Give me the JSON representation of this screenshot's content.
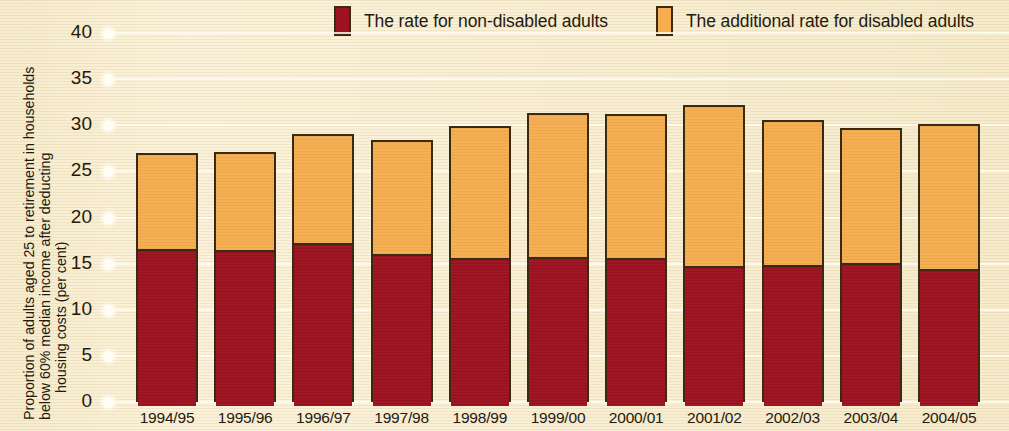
{
  "chart_data": {
    "type": "bar",
    "stacked": true,
    "title": "",
    "xlabel": "",
    "ylabel": "Proportion of adults aged 25 to retirement in households below 60% median income after deducting housing costs (per cent)",
    "ylabel_lines": [
      "Proportion of adults aged 25 to retirement in households",
      "below 60% median income after deducting",
      "housing costs (per cent)"
    ],
    "ylim": [
      0,
      40
    ],
    "yticks": [
      40,
      35,
      30,
      25,
      20,
      15,
      10,
      5,
      0
    ],
    "ytick_labels": [
      "40",
      "35",
      "30",
      "25",
      "20",
      "15",
      "10",
      "5",
      "0"
    ],
    "grid": true,
    "legend_position": "top",
    "categories": [
      "1994/95",
      "1995/96",
      "1996/97",
      "1997/98",
      "1998/99",
      "1999/00",
      "2000/01",
      "2001/02",
      "2002/03",
      "2003/04",
      "2004/05"
    ],
    "series": [
      {
        "name": "The rate for non-disabled adults",
        "color": "#9d1220",
        "values": [
          16.8,
          16.7,
          17.4,
          16.3,
          15.8,
          15.9,
          15.8,
          15.0,
          15.1,
          15.3,
          14.6
        ]
      },
      {
        "name": "The additional rate for disabled adults",
        "color": "#f5ad50",
        "values": [
          10.2,
          10.4,
          11.7,
          12.1,
          14.1,
          15.4,
          15.4,
          17.2,
          15.5,
          14.4,
          15.5
        ]
      }
    ],
    "totals": [
      27.0,
      27.1,
      29.1,
      28.4,
      29.9,
      31.3,
      31.2,
      32.2,
      30.6,
      29.7,
      30.1
    ]
  },
  "legend": {
    "items": [
      {
        "label": "The rate for non-disabled adults",
        "swatch": "red-swatch-icon",
        "color": "#9d1220"
      },
      {
        "label": "The additional rate for disabled adults",
        "swatch": "orange-swatch-icon",
        "color": "#f5ad50"
      }
    ]
  },
  "colors": {
    "background": "#f6ecd0",
    "non_disabled": "#9d1220",
    "disabled_additional": "#f5ad50",
    "bar_outline": "#3a2a14",
    "gridline": "#fffdf4",
    "text": "#241a0d"
  }
}
